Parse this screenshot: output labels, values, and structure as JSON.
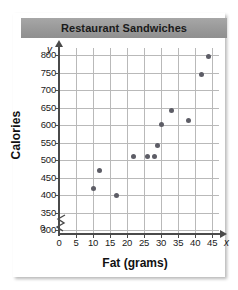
{
  "title": "Restaurant Sandwiches",
  "axis_letters": {
    "y": "y",
    "x": "x"
  },
  "zero_label": "0",
  "chart_data": {
    "type": "scatter",
    "title": "Restaurant Sandwiches",
    "xlabel": "Fat (grams)",
    "ylabel": "Calories",
    "xlim": [
      0,
      47
    ],
    "ylim": [
      290,
      820
    ],
    "grid": true,
    "legend": null,
    "axis_break_y": true,
    "xticks": [
      0,
      5,
      10,
      15,
      20,
      25,
      30,
      35,
      40,
      45
    ],
    "xtick_labels": [
      "0",
      "5",
      "10",
      "15",
      "20",
      "25",
      "30",
      "35",
      "40",
      "45"
    ],
    "yticks": [
      300,
      350,
      400,
      450,
      500,
      550,
      600,
      650,
      700,
      750,
      800
    ],
    "ytick_labels": [
      "300",
      "350",
      "400",
      "450",
      "500",
      "550",
      "600",
      "650",
      "700",
      "750",
      "800"
    ],
    "points": [
      {
        "x": 10,
        "y": 420
      },
      {
        "x": 12,
        "y": 470
      },
      {
        "x": 17,
        "y": 400
      },
      {
        "x": 22,
        "y": 512
      },
      {
        "x": 26,
        "y": 512
      },
      {
        "x": 28,
        "y": 512
      },
      {
        "x": 29,
        "y": 542
      },
      {
        "x": 30,
        "y": 602
      },
      {
        "x": 33,
        "y": 643
      },
      {
        "x": 38,
        "y": 613
      },
      {
        "x": 42,
        "y": 745
      },
      {
        "x": 44,
        "y": 795
      }
    ],
    "marker_color": "#5d5d66",
    "grid_color": "#b9b9b9",
    "axis_color": "#4a4a4a"
  }
}
